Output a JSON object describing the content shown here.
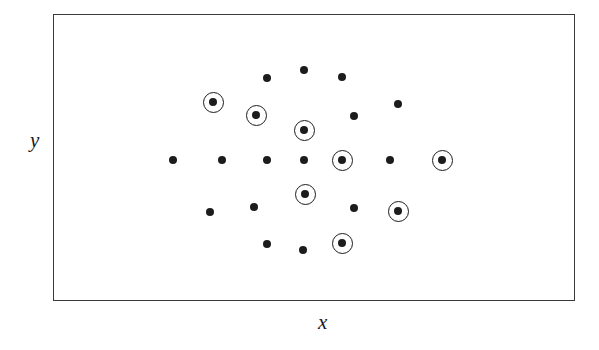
{
  "figure": {
    "background_color": "#ffffff",
    "frame": {
      "x": 53,
      "y": 14,
      "width": 522,
      "height": 287,
      "border_color": "#3a3a3a",
      "border_width": 1.5
    },
    "marker_color": "#1c1c1c",
    "dot_radius": 4.0,
    "ring_radius": 10.5
  },
  "chart_data": {
    "type": "scatter",
    "title": "",
    "subtitle": "",
    "xlabel": "x",
    "ylabel": "y",
    "grid": false,
    "legend_position": "none",
    "axis_ticks": [],
    "tick_labels": [],
    "annotations": [],
    "series": [
      {
        "name": "plain-points",
        "marker": "filled-circle",
        "highlighted": false,
        "points": [
          {
            "x": 267,
            "y": 78
          },
          {
            "x": 304,
            "y": 70
          },
          {
            "x": 342,
            "y": 77
          },
          {
            "x": 398,
            "y": 104
          },
          {
            "x": 354,
            "y": 116
          },
          {
            "x": 173,
            "y": 160
          },
          {
            "x": 222,
            "y": 160
          },
          {
            "x": 267,
            "y": 160
          },
          {
            "x": 304,
            "y": 160
          },
          {
            "x": 390,
            "y": 160
          },
          {
            "x": 210,
            "y": 212
          },
          {
            "x": 254,
            "y": 207
          },
          {
            "x": 354,
            "y": 208
          },
          {
            "x": 267,
            "y": 244
          },
          {
            "x": 303,
            "y": 250
          }
        ]
      },
      {
        "name": "circled-points",
        "marker": "filled-circle-with-ring",
        "highlighted": true,
        "points": [
          {
            "x": 213,
            "y": 102
          },
          {
            "x": 256,
            "y": 115
          },
          {
            "x": 304,
            "y": 130
          },
          {
            "x": 342,
            "y": 160
          },
          {
            "x": 442,
            "y": 160
          },
          {
            "x": 305,
            "y": 194
          },
          {
            "x": 398,
            "y": 211
          },
          {
            "x": 342,
            "y": 243
          }
        ]
      }
    ]
  },
  "labels": {
    "x_axis": {
      "text": "x",
      "left": 318,
      "top": 312
    },
    "y_axis": {
      "text": "y",
      "left": 30,
      "top": 130
    }
  }
}
